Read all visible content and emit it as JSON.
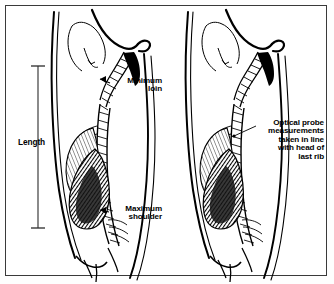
{
  "figure": {
    "panels": [
      {
        "id": "left-panel",
        "name": "length-and-limits-panel",
        "annotations": [
          {
            "name": "minimum-loin",
            "text": "Minimum\nloin"
          },
          {
            "name": "maximum-shoulder",
            "text": "Maximum\nshoulder"
          },
          {
            "name": "length",
            "text": "Length"
          }
        ]
      },
      {
        "id": "right-panel",
        "name": "optical-probe-panel",
        "annotations": [
          {
            "name": "optical-probe",
            "text": "Optical probe\nmeasurements\ntaken in line\nwith head of\nlast rib"
          }
        ]
      }
    ]
  },
  "colors": {
    "ink": "#000000",
    "frame": "#3a3a3a",
    "paper": "#ffffff",
    "shade_dark": "#1a1a1a",
    "shade_light": "#9a9a9a"
  },
  "measure_bar": {
    "name": "length-measure-bar",
    "orientation": "vertical",
    "top_y": 66,
    "bottom_y": 228,
    "x": 38
  }
}
